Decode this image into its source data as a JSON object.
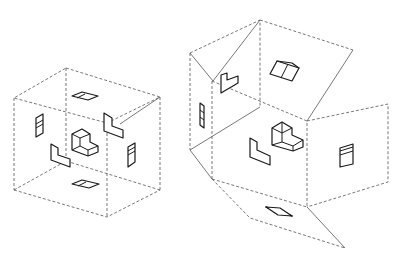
{
  "figure": {
    "left_panel": {
      "name": "glass-box-cube",
      "object": "L-shaped block at center",
      "views": [
        "top",
        "bottom",
        "front",
        "back",
        "left",
        "right"
      ]
    },
    "right_panel": {
      "name": "unfolded-glass-box",
      "object": "L-shaped block at center",
      "faces": [
        "top",
        "left-flap",
        "front",
        "right",
        "bottom"
      ]
    },
    "colors": {
      "line": "#1a1a1a",
      "dashed": "#555555",
      "background": "#ffffff"
    }
  }
}
